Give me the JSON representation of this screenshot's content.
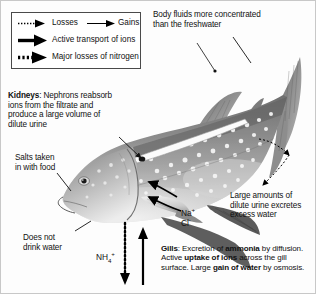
{
  "diagram": {
    "border_color": "#c8c8c8"
  },
  "legend": {
    "box_border": "#4a4a4a",
    "items": [
      {
        "label": "Losses",
        "icon": "fine-dotted-arrow-icon",
        "style": "fine-dotted"
      },
      {
        "label": "Gains",
        "icon": "thin-solid-arrow-icon",
        "style": "thin-solid"
      },
      {
        "label": "Active transport of ions",
        "icon": "thick-solid-arrow-icon",
        "style": "thick-solid"
      },
      {
        "label": "Major losses of nitrogen",
        "icon": "coarse-dotted-arrow-icon",
        "style": "coarse-dotted"
      }
    ]
  },
  "annotations": {
    "body_fluids": {
      "line1": "Body fluids more concentrated",
      "line2": "than the freshwater"
    },
    "kidneys": {
      "heading": "Kidneys",
      "colon": ":",
      "text": "Nephrons reabsorb ions from the filtrate and produce a large volume of dilute urine"
    },
    "salts": {
      "line1": "Salts taken",
      "line2": "in with food"
    },
    "does_not_drink": {
      "line1": "Does not",
      "line2": "drink water"
    },
    "large_amounts": {
      "line1": "Large amounts of",
      "line2": "dilute urine excretes",
      "line3": "excess water"
    },
    "gills": {
      "heading": "Gills",
      "colon": ":",
      "seg1": " Excretion of ",
      "bold1": "ammonia",
      "seg2": " by diffusion. Active ",
      "bold2": "uptake of ions",
      "seg3": " across the gill surface. Large ",
      "bold3": "gain of water",
      "seg4": " by osmosis."
    },
    "ions": {
      "sodium": "Na",
      "sodium_charge": "+",
      "chloride": "Cl",
      "chloride_charge": "-",
      "ammonium": "NH",
      "ammonium_sub": "4",
      "ammonium_charge": "+"
    }
  },
  "arrows": {
    "gill_uptake_upper": "active-transport-arrow-into-gill-upper",
    "gill_uptake_lower": "active-transport-arrow-into-gill-lower",
    "nitrogen_loss": "major-nitrogen-loss-down-arrow",
    "ion_uptake_vertical": "active-transport-up-arrow",
    "urine_loss": "dilute-urine-loss-dotted-arrow"
  }
}
